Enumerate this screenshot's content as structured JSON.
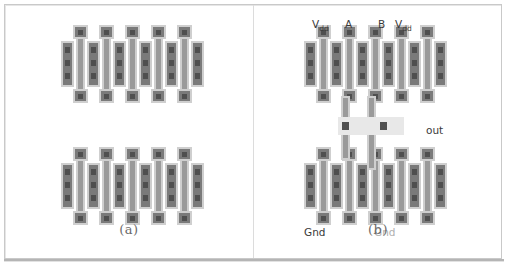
{
  "figure": {
    "kind": "vlsi-layout-figure",
    "panels": [
      {
        "id": "a",
        "caption": "(a)",
        "description": "Unconnected transistor array: two rows of five transistor cells",
        "rows": 2,
        "cells_per_row": 5,
        "labels": []
      },
      {
        "id": "b",
        "caption": "(b)",
        "description": "Routed logic gate: same transistor array with metal interconnect and labeled terminals",
        "rows": 2,
        "cells_per_row": 5,
        "labels": [
          {
            "name": "vdd-left",
            "text": "V",
            "sub": "dd",
            "style": "normal",
            "x": 58,
            "y": 14
          },
          {
            "name": "input-a",
            "text": "A",
            "sub": "",
            "style": "normal",
            "x": 91,
            "y": 14
          },
          {
            "name": "input-b",
            "text": "B",
            "sub": "",
            "style": "normal",
            "x": 124,
            "y": 14
          },
          {
            "name": "vdd-right",
            "text": "V",
            "sub": "dd",
            "style": "normal",
            "x": 141,
            "y": 14
          },
          {
            "name": "output",
            "text": "out",
            "sub": "",
            "style": "normal",
            "x": 172,
            "y": 120
          },
          {
            "name": "gnd-left",
            "text": "Gnd",
            "sub": "",
            "style": "normal",
            "x": 50,
            "y": 222
          },
          {
            "name": "gnd-right",
            "text": "Gnd",
            "sub": "",
            "style": "dim",
            "x": 120,
            "y": 222
          }
        ]
      }
    ]
  },
  "colors": {
    "background": "#ffffff",
    "frame_border": "#c9c9c9",
    "divider": "#dcdcdc",
    "device_outline": "#cfcfcf",
    "device_core": "#7a7a7a",
    "metal": "#9a9a9a",
    "metal_light": "#e8e8e8",
    "contact": "#4f4f4f",
    "label_text": "#3a3a3a",
    "label_text_dim": "#b0b0b0",
    "caption_text": "#6a6a6a"
  }
}
